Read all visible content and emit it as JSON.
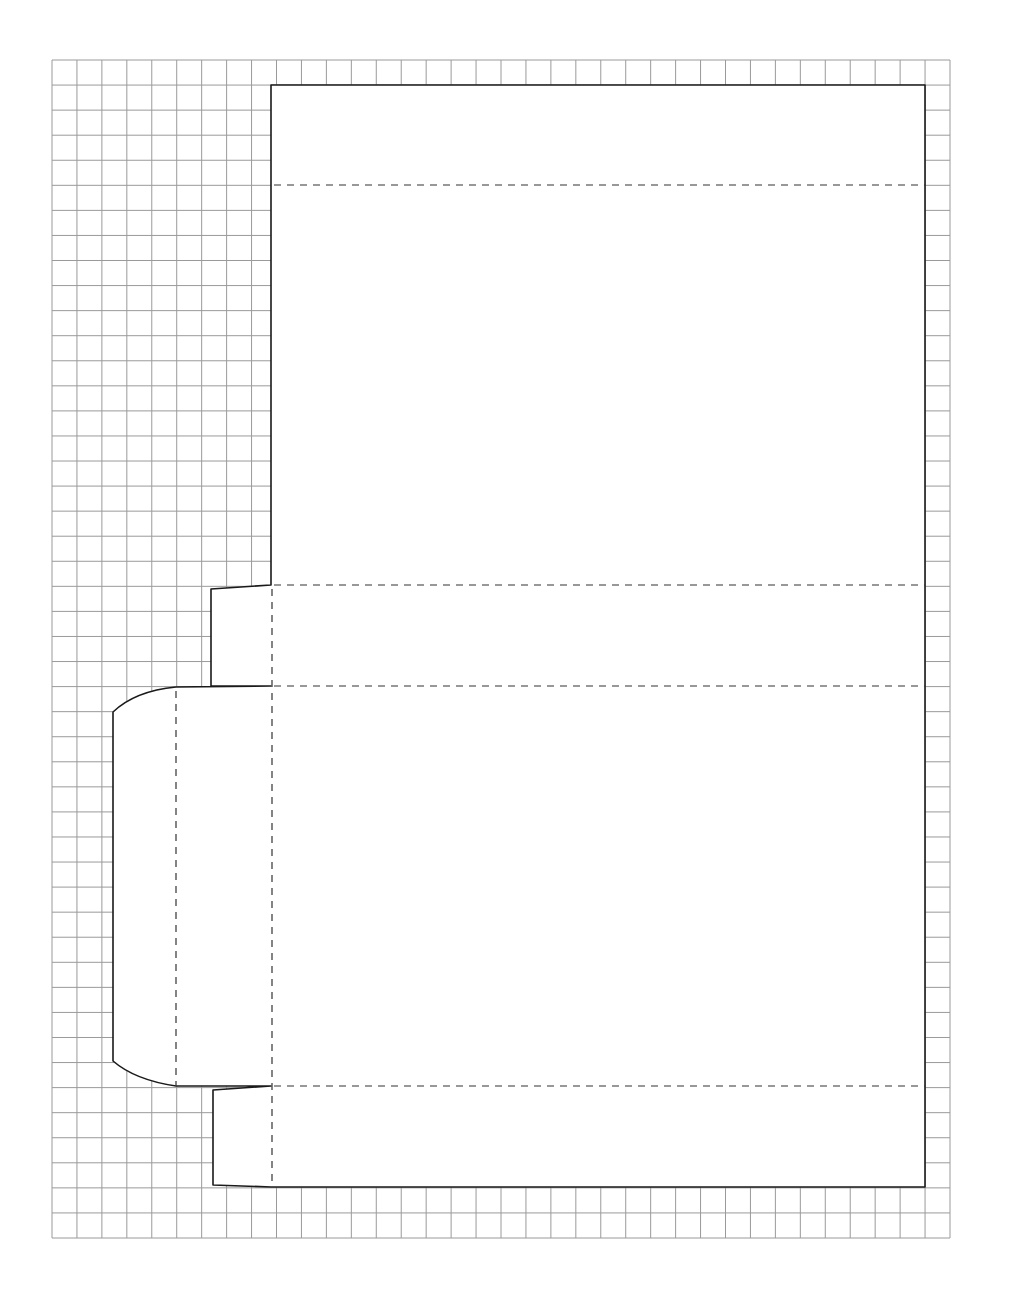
{
  "diagram": {
    "type": "box-dieline-template",
    "background_color": "#ffffff",
    "grid": {
      "x0": 52,
      "y0": 60,
      "x1": 950,
      "y1": 1238,
      "columns": 36,
      "rows": 47,
      "line_color": "#9a9a9a"
    },
    "cut_line_color": "#1a1a1a",
    "fold_line_color": "#333333",
    "panels": {
      "main_body": {
        "x": 271,
        "y": 85,
        "right": 925,
        "bottom": 1187
      },
      "upper_tab": {
        "left": 211,
        "top": 589,
        "bottom": 686
      },
      "side_flap": {
        "left": 113,
        "top": 687,
        "bottom": 1086,
        "curve_top_y": 712,
        "curve_bottom_y": 1061
      },
      "lower_tab": {
        "left": 213,
        "top": 1090,
        "bottom": 1185
      }
    },
    "fold_lines": {
      "horizontal_y": [
        185,
        585,
        686,
        1086
      ],
      "vertical_x": [
        176,
        272
      ]
    }
  }
}
